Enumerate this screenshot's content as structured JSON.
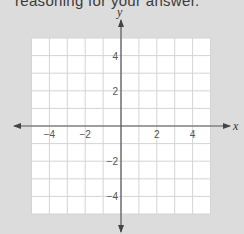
{
  "header": {
    "text": "reasoning for your answer."
  },
  "colors": {
    "background": "#dcdcdc",
    "grid_fill": "#ffffff",
    "grid_line": "#d4d4d4",
    "axis": "#555555",
    "tick_label": "#555555"
  },
  "chart_data": {
    "type": "line",
    "title": "",
    "xlabel": "x",
    "ylabel": "y",
    "xlim": [
      -5,
      5
    ],
    "ylim": [
      -5,
      5
    ],
    "grid": true,
    "grid_step": 1,
    "x_tick_labels": [
      "−4",
      "−2",
      "2",
      "4"
    ],
    "x_tick_values": [
      -4,
      -2,
      2,
      4
    ],
    "y_tick_labels": [
      "4",
      "2",
      "−2",
      "−4"
    ],
    "y_tick_values": [
      4,
      2,
      -2,
      -4
    ],
    "series": [],
    "axes_arrows": true
  },
  "axes": {
    "x_name": "x",
    "y_name": "y",
    "x_ticks": [
      {
        "label": "−4",
        "value": -4
      },
      {
        "label": "−2",
        "value": -2
      },
      {
        "label": "2",
        "value": 2
      },
      {
        "label": "4",
        "value": 4
      }
    ],
    "y_ticks": [
      {
        "label": "4",
        "value": 4
      },
      {
        "label": "2",
        "value": 2
      },
      {
        "label": "−2",
        "value": -2
      },
      {
        "label": "−4",
        "value": -4
      }
    ]
  }
}
